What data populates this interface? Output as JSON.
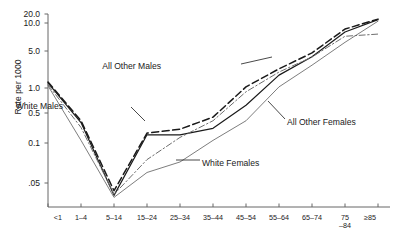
{
  "chart_data": {
    "type": "line",
    "title": "",
    "xlabel": "",
    "ylabel": "Rate per 1000",
    "scale": "log",
    "grid": false,
    "legend_position": "inline-annotations",
    "categories": [
      "<1",
      "1–4",
      "5–14",
      "15–24",
      "25–34",
      "35–44",
      "45–54",
      "55–64",
      "65–74",
      "75–84",
      "≥85"
    ],
    "ytick_labels": [
      "20.0",
      "10.0",
      "5.0",
      "1.0",
      "0.5",
      "0.1",
      ".05"
    ],
    "ytick_values": [
      20.0,
      10.0,
      5.0,
      1.0,
      0.5,
      0.1,
      0.05
    ],
    "ylim": [
      0.025,
      22.0
    ],
    "series": [
      {
        "name": "All Other Males",
        "style": "dashed",
        "color": "#1a1a1a",
        "width": 1.5,
        "values": [
          1.3,
          0.33,
          0.04,
          0.17,
          0.21,
          0.4,
          1.05,
          2.3,
          4.6,
          8.6,
          13.5
        ]
      },
      {
        "name": "White Males",
        "style": "solid",
        "color": "#1a1a1a",
        "width": 1.2,
        "values": [
          1.25,
          0.3,
          0.035,
          0.155,
          0.155,
          0.22,
          0.62,
          1.75,
          3.9,
          8.0,
          13.0
        ]
      },
      {
        "name": "All Other Females",
        "style": "dash-dot",
        "color": "#6e6e6e",
        "width": 1.0,
        "values": [
          1.15,
          0.23,
          0.036,
          0.075,
          0.135,
          0.33,
          0.9,
          2.0,
          3.85,
          7.2,
          7.6
        ]
      },
      {
        "name": "White Females",
        "style": "solid-thin",
        "color": "#6e6e6e",
        "width": 0.9,
        "values": [
          1.1,
          0.115,
          0.033,
          0.06,
          0.072,
          0.115,
          0.33,
          1.05,
          2.7,
          6.2,
          11.5
        ]
      }
    ],
    "annotations": [
      {
        "text": "All Other Males",
        "x": 161,
        "y": 66
      },
      {
        "text": "White Males",
        "x": 63,
        "y": 106
      },
      {
        "text": "All Other Females",
        "x": 287,
        "y": 122
      },
      {
        "text": "White Females",
        "x": 202,
        "y": 163
      }
    ]
  }
}
